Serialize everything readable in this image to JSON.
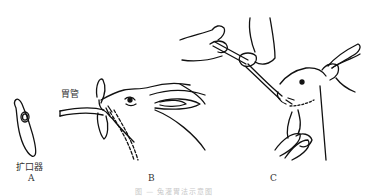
{
  "figure": {
    "panels": [
      {
        "id": "A",
        "label": "A",
        "part_label": "扩口器"
      },
      {
        "id": "B",
        "label": "B",
        "part_label": "胃管"
      },
      {
        "id": "C",
        "label": "C"
      }
    ],
    "caption": "图 — 兔灌胃法示意图"
  }
}
